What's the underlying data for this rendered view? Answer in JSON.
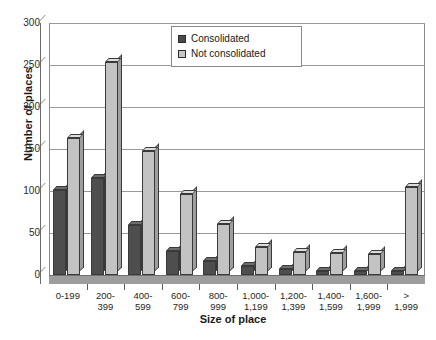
{
  "chart_data": {
    "type": "bar",
    "title": "",
    "subtitle": "",
    "xlabel": "Size of place",
    "ylabel": "Number of places",
    "ylim": [
      0,
      300
    ],
    "ytick_step": 50,
    "yticks": [
      0,
      50,
      100,
      150,
      200,
      250,
      300
    ],
    "ytick_labels": [
      "0",
      "50",
      "100",
      "150",
      "200",
      "250",
      "300"
    ],
    "grid": true,
    "grid_axis": "y",
    "legend_position": "top-center",
    "style": "3d-clustered-column",
    "categories": [
      "0-199",
      "200-\n399",
      "400-\n599",
      "600-\n799",
      "800-\n999",
      "1,000-\n1,199",
      "1,200-\n1,399",
      "1,400-\n1,599",
      "1,600-\n1,999",
      ">\n1,999"
    ],
    "series": [
      {
        "name": "Consolidated",
        "color": "#4e4e4e",
        "values": [
          101,
          115,
          60,
          29,
          17,
          11,
          7,
          5,
          5,
          5
        ]
      },
      {
        "name": "Not consolidated",
        "color": "#c3c3c3",
        "values": [
          163,
          253,
          148,
          96,
          61,
          33,
          27,
          26,
          25,
          105
        ]
      }
    ],
    "annotations": []
  },
  "legend": {
    "items": [
      {
        "label": "Consolidated",
        "swatch": "dark-square-swatch"
      },
      {
        "label": "Not consolidated",
        "swatch": "light-square-swatch"
      }
    ]
  }
}
